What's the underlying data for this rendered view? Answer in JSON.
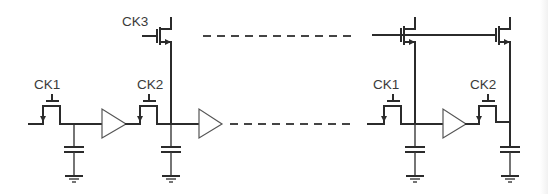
{
  "diagram": {
    "type": "circuit-schematic",
    "colors": {
      "wire": "#2b2b2b",
      "background": "#ffffff",
      "buffer_outline": "#555555"
    },
    "labels": {
      "ck1_left": "CK1",
      "ck2_left": "CK2",
      "ck3": "CK3",
      "ck1_right": "CK1",
      "ck2_right": "CK2"
    },
    "stages": [
      {
        "id": "left-stage-1",
        "switch_clock": "CK1",
        "has_buffer": true,
        "has_capacitor": true
      },
      {
        "id": "left-stage-2",
        "switch_clock": "CK2",
        "has_buffer": true,
        "has_capacitor": true,
        "select_transistor_clock": "CK3"
      },
      {
        "id": "right-stage-1",
        "switch_clock": "CK1",
        "has_buffer": true,
        "has_capacitor": true,
        "select_transistor": true
      },
      {
        "id": "right-stage-2",
        "switch_clock": "CK2",
        "has_buffer": false,
        "has_capacitor": true,
        "select_transistor": true
      }
    ],
    "continuation": {
      "top_line": "dashed",
      "bottom_line": "dashed"
    }
  }
}
